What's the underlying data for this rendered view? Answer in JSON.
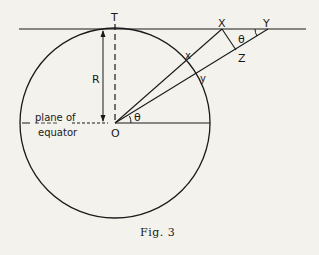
{
  "figure": {
    "caption": "Fig. 3",
    "labels": {
      "T": "T",
      "X": "X",
      "Y": "Y",
      "Z": "Z",
      "x": "x",
      "y": "y",
      "R": "R",
      "O": "O",
      "theta_center": "θ",
      "theta_top": "θ",
      "plane": "plane of",
      "equator": "equator"
    }
  }
}
